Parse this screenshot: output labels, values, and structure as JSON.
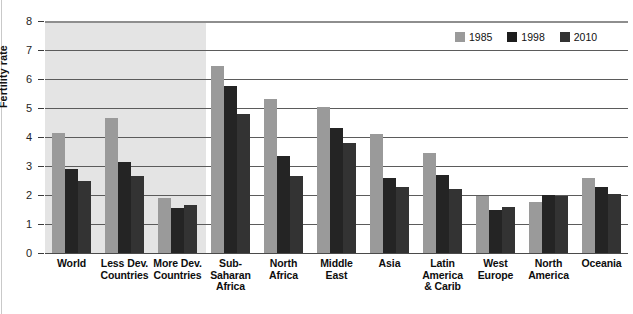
{
  "chart_data": {
    "type": "bar",
    "title": "",
    "xlabel": "",
    "ylabel": "Fertility rate",
    "ylim": [
      0,
      8
    ],
    "yticks": [
      "0",
      "1",
      "2",
      "3",
      "4",
      "5",
      "6",
      "7",
      "8"
    ],
    "grid": true,
    "legend_position": "top-right",
    "categories": [
      "World",
      "Less Dev. Countries",
      "More Dev. Countries",
      "Sub-Saharan Africa",
      "North Africa",
      "Middle East",
      "Asia",
      "Latin America & Carib",
      "West Europe",
      "North America",
      "Oceania"
    ],
    "category_lines": [
      [
        "World"
      ],
      [
        "Less Dev.",
        "Countries"
      ],
      [
        "More Dev.",
        "Countries"
      ],
      [
        "Sub-",
        "Saharan",
        "Africa"
      ],
      [
        "North",
        "Africa"
      ],
      [
        "Middle",
        "East"
      ],
      [
        "Asia"
      ],
      [
        "Latin",
        "America",
        "& Carib"
      ],
      [
        "West",
        "Europe"
      ],
      [
        "North",
        "America"
      ],
      [
        "Oceania"
      ]
    ],
    "series": [
      {
        "name": "1985",
        "color": "#9a9a9a",
        "values": [
          4.15,
          4.65,
          1.88,
          6.45,
          5.3,
          5.05,
          4.1,
          3.45,
          1.95,
          1.75,
          2.6
        ]
      },
      {
        "name": "1998",
        "color": "#242424",
        "values": [
          2.9,
          3.15,
          1.55,
          5.75,
          3.35,
          4.3,
          2.6,
          2.7,
          1.5,
          2.0,
          2.28
        ]
      },
      {
        "name": "2010",
        "color": "#333333",
        "values": [
          2.48,
          2.67,
          1.67,
          4.78,
          2.65,
          3.8,
          2.28,
          2.2,
          1.6,
          1.95,
          2.02
        ]
      }
    ],
    "shaded_region": {
      "label": "aggregate-groups-shading",
      "covers_categories": [
        "World",
        "Less Dev. Countries",
        "More Dev. Countries"
      ],
      "color": "#e4e4e4"
    }
  },
  "legend": {
    "items": [
      {
        "label": "1985",
        "color": "#9a9a9a"
      },
      {
        "label": "1998",
        "color": "#1d1d1d"
      },
      {
        "label": "2010",
        "color": "#333333"
      }
    ]
  },
  "axis": {
    "y_title": "Fertility rate"
  }
}
